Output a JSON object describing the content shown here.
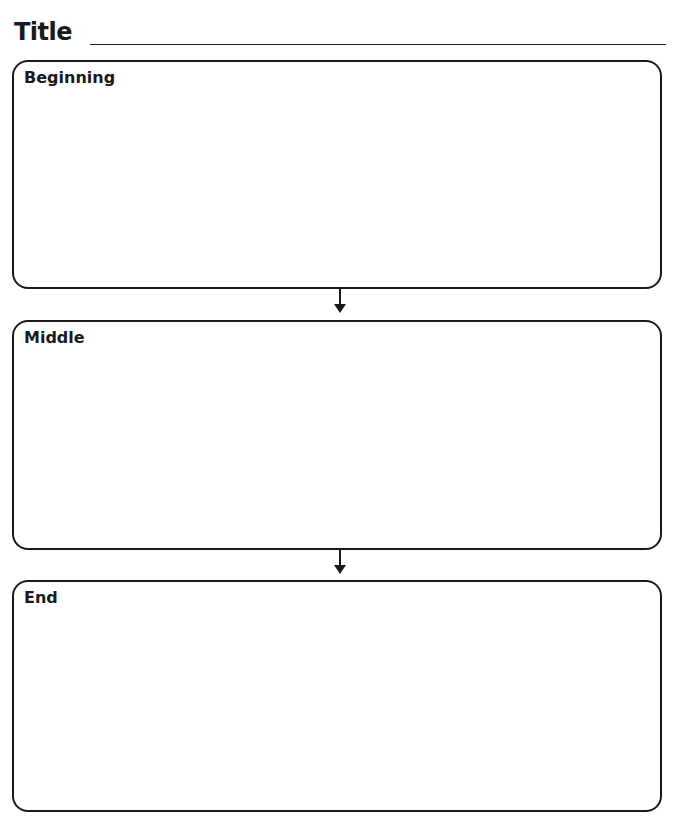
{
  "title": {
    "label": "Title",
    "value": ""
  },
  "sections": [
    {
      "label": "Beginning",
      "content": ""
    },
    {
      "label": "Middle",
      "content": ""
    },
    {
      "label": "End",
      "content": ""
    }
  ],
  "icons": [
    "arrow-down-icon",
    "arrow-down-icon"
  ],
  "colors": {
    "line": "#1a1a1a",
    "background": "#ffffff"
  }
}
